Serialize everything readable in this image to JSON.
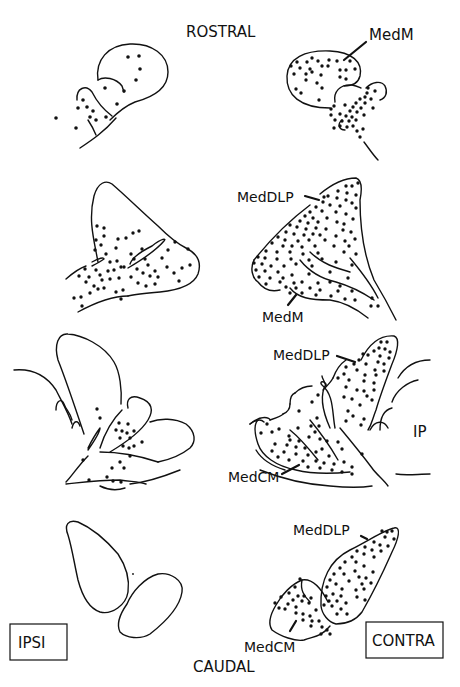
{
  "figure": {
    "orientation_top": "ROSTRAL",
    "orientation_bottom": "CAUDAL",
    "side_left": "IPSI",
    "side_right": "CONTRA",
    "sections": [
      {
        "level": 1,
        "ipsi": {
          "labels": []
        },
        "contra": {
          "labels": [
            "MedM"
          ]
        }
      },
      {
        "level": 2,
        "ipsi": {
          "labels": []
        },
        "contra": {
          "labels": [
            "MedDLP",
            "MedM"
          ]
        }
      },
      {
        "level": 3,
        "ipsi": {
          "labels": []
        },
        "contra": {
          "labels": [
            "MedDLP",
            "MedCM",
            "IP"
          ]
        }
      },
      {
        "level": 4,
        "ipsi": {
          "labels": []
        },
        "contra": {
          "labels": [
            "MedDLP",
            "MedCM"
          ]
        }
      }
    ]
  },
  "labels": {
    "rostral": "ROSTRAL",
    "caudal": "CAUDAL",
    "ipsi": "IPSI",
    "contra": "CONTRA",
    "s1_medm": "MedM",
    "s2_meddlp": "MedDLP",
    "s2_medm": "MedM",
    "s3_meddlp": "MedDLP",
    "s3_medcm": "MedCM",
    "s3_ip": "IP",
    "s4_meddlp": "MedDLP",
    "s4_medcm": "MedCM"
  },
  "colors": {
    "ink": "#111111",
    "background": "#ffffff"
  }
}
